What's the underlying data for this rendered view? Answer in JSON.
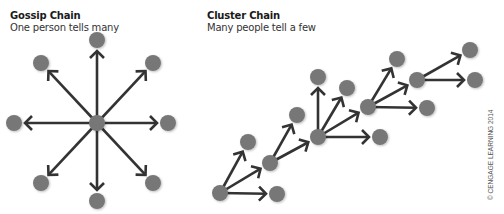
{
  "gossip": {
    "title": "Gossip Chain",
    "subtitle": "One person tells many",
    "center": [
      97,
      123
    ],
    "nodes": [
      [
        97,
        40
      ],
      [
        41,
        63
      ],
      [
        153,
        63
      ],
      [
        14,
        123
      ],
      [
        168,
        123
      ],
      [
        41,
        183
      ],
      [
        153,
        183
      ],
      [
        97,
        201
      ]
    ]
  },
  "cluster": {
    "title": "Cluster Chain",
    "subtitle": "Many people tell a few",
    "edges": [
      [
        [
          220,
          193
        ],
        [
          248,
          142
        ]
      ],
      [
        [
          220,
          193
        ],
        [
          270,
          163
        ]
      ],
      [
        [
          220,
          193
        ],
        [
          277,
          194
        ]
      ],
      [
        [
          270,
          163
        ],
        [
          297,
          115
        ]
      ],
      [
        [
          270,
          163
        ],
        [
          318,
          137
        ]
      ],
      [
        [
          318,
          137
        ],
        [
          318,
          77
        ]
      ],
      [
        [
          318,
          137
        ],
        [
          347,
          88
        ]
      ],
      [
        [
          318,
          137
        ],
        [
          368,
          107
        ]
      ],
      [
        [
          318,
          137
        ],
        [
          380,
          137
        ]
      ],
      [
        [
          368,
          107
        ],
        [
          397,
          59
        ]
      ],
      [
        [
          368,
          107
        ],
        [
          417,
          80
        ]
      ],
      [
        [
          368,
          107
        ],
        [
          427,
          108
        ]
      ],
      [
        [
          417,
          80
        ],
        [
          470,
          50
        ]
      ],
      [
        [
          417,
          80
        ],
        [
          475,
          80
        ]
      ]
    ],
    "nodes": [
      [
        220,
        193
      ],
      [
        277,
        194
      ],
      [
        248,
        142
      ],
      [
        270,
        163
      ],
      [
        297,
        115
      ],
      [
        318,
        137
      ],
      [
        380,
        137
      ],
      [
        318,
        77
      ],
      [
        347,
        88
      ],
      [
        368,
        107
      ],
      [
        397,
        59
      ],
      [
        427,
        108
      ],
      [
        417,
        80
      ],
      [
        470,
        50
      ],
      [
        475,
        80
      ]
    ]
  },
  "credit": "© CENGAGE LEARNING 2014",
  "colors": {
    "node": "#777777",
    "line": "#333333"
  }
}
